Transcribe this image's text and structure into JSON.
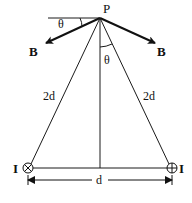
{
  "diagram": {
    "point_label": "P",
    "field_left_label": "B",
    "field_right_label": "B",
    "angle_top_label": "θ",
    "angle_inner_label": "θ",
    "side_left_label": "2d",
    "side_right_label": "2d",
    "base_label": "d",
    "current_left_label": "I",
    "current_right_label": "I",
    "current_left_symbol": "⊗",
    "current_right_symbol": "⊕",
    "line_color": "#1a1a1a"
  }
}
